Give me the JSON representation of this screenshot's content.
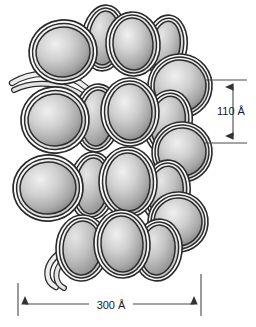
{
  "figure": {
    "background_color": "#ffffff",
    "outline_color": "#2b2b2b",
    "dna_band_color": "#f2f2f2",
    "core_light": "#efefef",
    "core_mid": "#b9b9b9",
    "core_dark": "#8e8e8e",
    "dimension_line_color": "#4a4a4a",
    "text_color": "#1a1a1a"
  },
  "annotations": {
    "vertical_dimension": {
      "label": "110 Å",
      "value": 110,
      "unit": "Å",
      "orientation": "vertical",
      "position": "right"
    },
    "horizontal_dimension": {
      "label": "300 Å",
      "value": 300,
      "unit": "Å",
      "orientation": "horizontal",
      "position": "bottom"
    }
  },
  "structure": {
    "element_name": "nucleosome",
    "dna_linker_count": 2,
    "nucleosomes": [
      {
        "id": "n01",
        "cx": 63,
        "cy": 52,
        "rx": 27,
        "ry": 25,
        "rot": -8,
        "wraps": 3,
        "wrap_side": "right",
        "depth": 3
      },
      {
        "id": "n02",
        "cx": 104,
        "cy": 38,
        "rx": 15,
        "ry": 27,
        "rot": 6,
        "wraps": 3,
        "wrap_side": "both",
        "depth": 2
      },
      {
        "id": "n03",
        "cx": 133,
        "cy": 44,
        "rx": 20,
        "ry": 26,
        "rot": -4,
        "wraps": 3,
        "wrap_side": "right",
        "depth": 2
      },
      {
        "id": "n04",
        "cx": 166,
        "cy": 46,
        "rx": 14,
        "ry": 25,
        "rot": 8,
        "wraps": 3,
        "wrap_side": "both",
        "depth": 1
      },
      {
        "id": "n05",
        "cx": 180,
        "cy": 86,
        "rx": 26,
        "ry": 26,
        "rot": 6,
        "wraps": 3,
        "wrap_side": "left",
        "depth": 1
      },
      {
        "id": "n06",
        "cx": 55,
        "cy": 120,
        "rx": 27,
        "ry": 26,
        "rot": -6,
        "wraps": 3,
        "wrap_side": "right",
        "depth": 3
      },
      {
        "id": "n07",
        "cx": 97,
        "cy": 118,
        "rx": 16,
        "ry": 28,
        "rot": 4,
        "wraps": 3,
        "wrap_side": "both",
        "depth": 2
      },
      {
        "id": "n08",
        "cx": 130,
        "cy": 112,
        "rx": 22,
        "ry": 28,
        "rot": -2,
        "wraps": 3,
        "wrap_side": "right",
        "depth": 2
      },
      {
        "id": "n09",
        "cx": 168,
        "cy": 122,
        "rx": 17,
        "ry": 26,
        "rot": 10,
        "wraps": 3,
        "wrap_side": "both",
        "depth": 1
      },
      {
        "id": "n10",
        "cx": 182,
        "cy": 152,
        "rx": 24,
        "ry": 24,
        "rot": 4,
        "wraps": 3,
        "wrap_side": "left",
        "depth": 1
      },
      {
        "id": "n11",
        "cx": 48,
        "cy": 188,
        "rx": 28,
        "ry": 26,
        "rot": -6,
        "wraps": 3,
        "wrap_side": "right",
        "depth": 3
      },
      {
        "id": "n12",
        "cx": 92,
        "cy": 186,
        "rx": 16,
        "ry": 28,
        "rot": 4,
        "wraps": 3,
        "wrap_side": "both",
        "depth": 2
      },
      {
        "id": "n13",
        "cx": 128,
        "cy": 182,
        "rx": 22,
        "ry": 29,
        "rot": -2,
        "wraps": 3,
        "wrap_side": "right",
        "depth": 2
      },
      {
        "id": "n14",
        "cx": 166,
        "cy": 192,
        "rx": 17,
        "ry": 26,
        "rot": 8,
        "wraps": 3,
        "wrap_side": "both",
        "depth": 1
      },
      {
        "id": "n15",
        "cx": 178,
        "cy": 222,
        "rx": 24,
        "ry": 24,
        "rot": 4,
        "wraps": 3,
        "wrap_side": "left",
        "depth": 1
      },
      {
        "id": "n16",
        "cx": 82,
        "cy": 248,
        "rx": 19,
        "ry": 27,
        "rot": 3,
        "wraps": 3,
        "wrap_side": "both",
        "depth": 2
      },
      {
        "id": "n17",
        "cx": 122,
        "cy": 244,
        "rx": 21,
        "ry": 28,
        "rot": -3,
        "wraps": 3,
        "wrap_side": "right",
        "depth": 2
      },
      {
        "id": "n18",
        "cx": 158,
        "cy": 250,
        "rx": 17,
        "ry": 25,
        "rot": 7,
        "wraps": 3,
        "wrap_side": "both",
        "depth": 1
      }
    ]
  }
}
